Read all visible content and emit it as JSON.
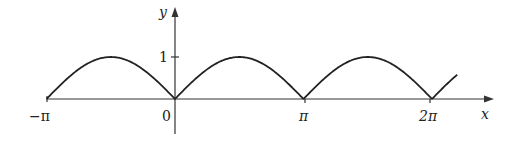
{
  "chart_data": {
    "type": "line",
    "title": "",
    "function": "y = |sin x|",
    "xlabel": "x",
    "ylabel": "y",
    "xlim": [
      -3.14159,
      6.9
    ],
    "ylim": [
      0,
      1
    ],
    "x_ticks": [
      {
        "value": -3.14159,
        "label": "−π"
      },
      {
        "value": 0,
        "label": "0"
      },
      {
        "value": 3.14159,
        "label": "π"
      },
      {
        "value": 6.28319,
        "label": "2π"
      }
    ],
    "y_ticks": [
      {
        "value": 1,
        "label": "1"
      }
    ],
    "grid": false,
    "legend": null,
    "series": [
      {
        "name": "|sin x|",
        "x": [
          -3.1416,
          -2.3562,
          -1.5708,
          -0.7854,
          0,
          0.7854,
          1.5708,
          2.3562,
          3.1416,
          3.927,
          4.7124,
          5.4978,
          6.2832,
          6.9
        ],
        "values": [
          0,
          0.707,
          1,
          0.707,
          0,
          0.707,
          1,
          0.707,
          0,
          0.707,
          1,
          0.707,
          0,
          0.59
        ]
      }
    ],
    "color": "#222222"
  },
  "labels": {
    "x_axis": "x",
    "y_axis": "y",
    "neg_pi": "−π",
    "zero": "0",
    "pi": "π",
    "two_pi": "2π",
    "one": "1"
  }
}
